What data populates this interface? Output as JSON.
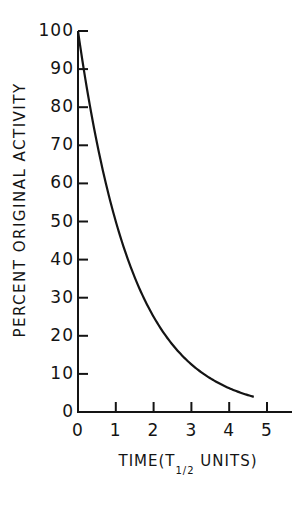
{
  "chart_data": {
    "type": "line",
    "title": "",
    "xlabel": "TIME(T1/2 UNITS)",
    "xlabel_main": "TIME(T",
    "xlabel_sub": "1/2",
    "xlabel_end": " UNITS)",
    "ylabel": "PERCENT ORIGINAL ACTIVITY",
    "xlim": [
      0,
      5.6
    ],
    "ylim": [
      0,
      100
    ],
    "x_ticks": [
      "0",
      "1",
      "2",
      "3",
      "4",
      "5"
    ],
    "y_ticks": [
      "0",
      "10",
      "20",
      "30",
      "40",
      "50",
      "60",
      "70",
      "80",
      "90",
      "100"
    ],
    "grid": false,
    "legend": null,
    "series": [
      {
        "name": "Decay curve",
        "function": "100 * 0.5^t",
        "x": [
          0,
          0.5,
          1,
          1.5,
          2,
          2.5,
          3,
          3.5,
          4,
          4.5,
          4.65
        ],
        "values": [
          100,
          70.7,
          50,
          35.4,
          25,
          17.7,
          12.5,
          8.8,
          6.25,
          4.4,
          4.0
        ]
      }
    ],
    "color": "#141414"
  }
}
